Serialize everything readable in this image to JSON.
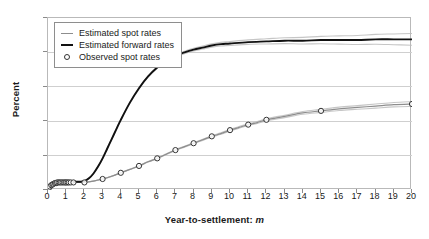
{
  "chart_data": {
    "type": "line",
    "title": "",
    "xlabel": "Year-to-settlement: m",
    "xlabel_plain": "Year-to-settlement:",
    "xlabel_italic": "m",
    "ylabel": "Percent",
    "xlim": [
      0,
      20
    ],
    "ylim": [
      0.0,
      2.5
    ],
    "grid": "horizontal",
    "legend_position": "top-left",
    "xticks": [
      0,
      1,
      2,
      3,
      4,
      5,
      6,
      7,
      8,
      9,
      10,
      11,
      12,
      13,
      14,
      15,
      16,
      17,
      18,
      19,
      20
    ],
    "xticklabels": [
      "0",
      "1",
      "2",
      "3",
      "4",
      "5",
      "6",
      "7",
      "8",
      "9",
      "10",
      "11",
      "12",
      "13",
      "14",
      "15",
      "16",
      "17",
      "18",
      "19",
      "20"
    ],
    "yticks": [
      0.0,
      0.5,
      1.0,
      1.5,
      2.0,
      2.5
    ],
    "yticklabels": [
      "0.0",
      "0.5",
      "1.0",
      "1.5",
      "2.0",
      "2.5"
    ],
    "gridlines": [
      0.5,
      1.0,
      1.5,
      2.0
    ],
    "series": [
      {
        "name": "Estimated spot rates",
        "style": "thin-line",
        "color": "#8d8d8d",
        "x": [
          0.0,
          0.25,
          0.5,
          0.75,
          1.0,
          1.25,
          1.5,
          1.75,
          2.0,
          2.5,
          3.0,
          3.5,
          4.0,
          4.5,
          5.0,
          5.5,
          6.0,
          6.5,
          7.0,
          7.5,
          8.0,
          8.5,
          9.0,
          9.5,
          10.0,
          10.5,
          11.0,
          11.5,
          12.0,
          13.0,
          14.0,
          15.0,
          16.0,
          17.0,
          18.0,
          19.0,
          20.0
        ],
        "values": [
          0.02,
          0.07,
          0.1,
          0.11,
          0.11,
          0.11,
          0.11,
          0.11,
          0.11,
          0.13,
          0.16,
          0.2,
          0.25,
          0.3,
          0.35,
          0.41,
          0.46,
          0.52,
          0.58,
          0.63,
          0.68,
          0.73,
          0.78,
          0.82,
          0.87,
          0.91,
          0.95,
          0.98,
          1.02,
          1.07,
          1.12,
          1.15,
          1.18,
          1.2,
          1.22,
          1.24,
          1.25
        ]
      },
      {
        "name": "Estimated forward rates",
        "style": "thick-line",
        "color": "#111111",
        "x": [
          0.0,
          0.25,
          0.5,
          0.75,
          1.0,
          1.25,
          1.5,
          1.75,
          2.0,
          2.25,
          2.5,
          2.75,
          3.0,
          3.25,
          3.5,
          3.75,
          4.0,
          4.5,
          5.0,
          5.5,
          6.0,
          6.5,
          7.0,
          7.5,
          8.0,
          8.5,
          9.0,
          9.5,
          10.0,
          11.0,
          12.0,
          13.0,
          14.0,
          15.0,
          16.0,
          17.0,
          18.0,
          19.0,
          20.0
        ],
        "values": [
          0.02,
          0.08,
          0.11,
          0.12,
          0.12,
          0.12,
          0.12,
          0.12,
          0.13,
          0.17,
          0.24,
          0.34,
          0.46,
          0.6,
          0.74,
          0.88,
          1.02,
          1.27,
          1.48,
          1.65,
          1.78,
          1.88,
          1.95,
          2.0,
          2.04,
          2.07,
          2.1,
          2.12,
          2.13,
          2.15,
          2.16,
          2.17,
          2.17,
          2.18,
          2.18,
          2.18,
          2.19,
          2.19,
          2.19
        ]
      },
      {
        "name": "Observed spot rates",
        "style": "open-circle",
        "color": "#333333",
        "x": [
          0.05,
          0.1,
          0.18,
          0.25,
          0.3,
          0.38,
          0.45,
          0.5,
          0.58,
          0.65,
          0.72,
          0.8,
          0.88,
          0.95,
          1.0,
          1.08,
          1.15,
          1.25,
          1.4,
          2.0,
          3.0,
          4.0,
          5.0,
          6.0,
          7.0,
          8.0,
          9.0,
          10.0,
          11.0,
          12.0,
          15.0,
          20.0
        ],
        "values": [
          0.03,
          0.05,
          0.07,
          0.08,
          0.09,
          0.1,
          0.1,
          0.11,
          0.11,
          0.11,
          0.11,
          0.11,
          0.11,
          0.11,
          0.11,
          0.11,
          0.11,
          0.11,
          0.11,
          0.11,
          0.16,
          0.25,
          0.35,
          0.46,
          0.58,
          0.68,
          0.78,
          0.87,
          0.95,
          1.02,
          1.15,
          1.25
        ]
      }
    ],
    "confidence_band": {
      "description": "shaded band around estimated curves",
      "spot_upper_at_20": 1.28,
      "spot_lower_at_20": 1.22,
      "forward_upper_at_20": 2.25,
      "forward_lower_at_20": 2.1
    }
  },
  "legend": {
    "items": [
      {
        "label": "Estimated spot rates",
        "key": "thin-line"
      },
      {
        "label": "Estimated forward rates",
        "key": "thick-line"
      },
      {
        "label": "Observed spot rates",
        "key": "open-circle"
      }
    ]
  },
  "colors": {
    "spot": "#8d8d8d",
    "forward": "#111111",
    "marker": "#333333",
    "grid": "#cfcfcf",
    "frame": "#b9b9b9",
    "band": "#bcbcbc"
  }
}
